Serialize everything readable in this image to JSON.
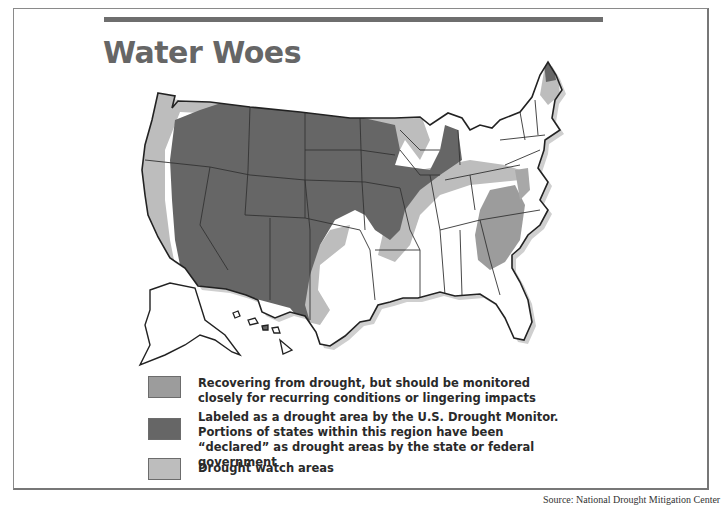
{
  "title": "Water Woes",
  "colors": {
    "recovering": "#9c9c9c",
    "drought": "#666666",
    "watch": "#bdbdbd",
    "rule": "#6e6e6e",
    "title": "#666666"
  },
  "legend": [
    {
      "key": "recovering",
      "label": "Recovering from drought, but should be monitored closely for recurring conditions or lingering impacts"
    },
    {
      "key": "drought",
      "label": "Labeled as a drought area by the U.S. Drought Monitor. Portions of states within this region have been “declared” as drought areas by the state or federal government"
    },
    {
      "key": "watch",
      "label": "Drought watch areas"
    }
  ],
  "source": "Source: National Drought Mitigation Center"
}
